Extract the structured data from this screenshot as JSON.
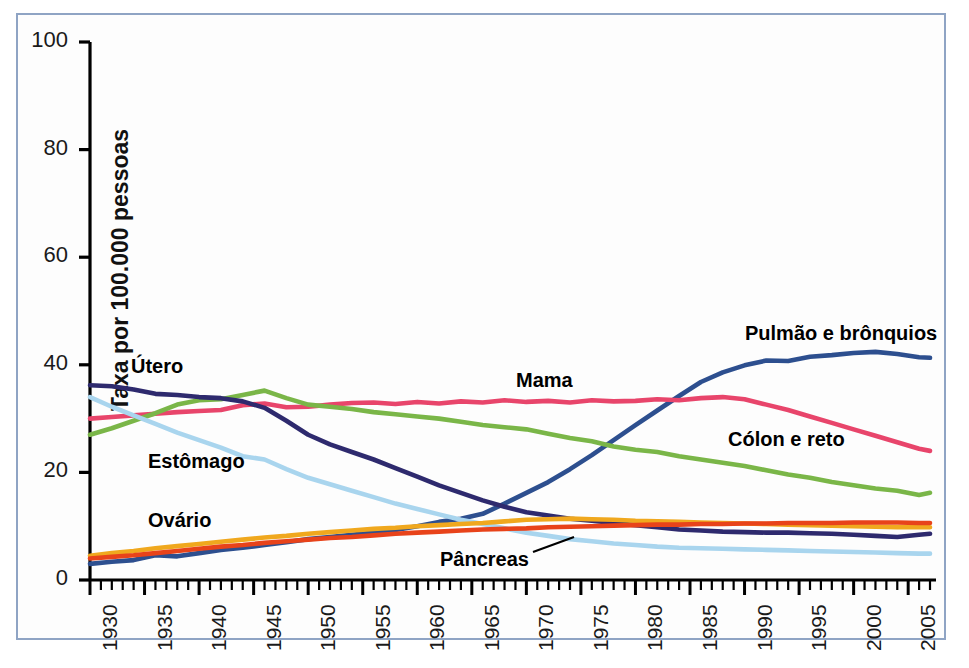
{
  "figure": {
    "border_color": "#8fa4c4",
    "background": "#ffffff"
  },
  "chart_data": {
    "type": "line",
    "title": "",
    "subtitle": "",
    "xlabel": "",
    "ylabel": "Taxa por 100.000 pessoas",
    "xlim": [
      1930,
      2007
    ],
    "ylim": [
      0,
      100
    ],
    "yticks": [
      0,
      20,
      40,
      60,
      80,
      100
    ],
    "ytick_labels": [
      "0",
      "20",
      "40",
      "60",
      "80",
      "100"
    ],
    "xticks": [
      1930,
      1935,
      1940,
      1945,
      1950,
      1955,
      1960,
      1965,
      1970,
      1975,
      1980,
      1985,
      1990,
      1995,
      2000,
      2005
    ],
    "xtick_labels": [
      "1930",
      "1935",
      "1940",
      "1945",
      "1950",
      "1955",
      "1960",
      "1965",
      "1970",
      "1975",
      "1980",
      "1985",
      "1990",
      "1995",
      "2000",
      "2005"
    ],
    "minor_tick_interval": 1,
    "grid": false,
    "legend_position": "inline-annotations",
    "x": [
      1930,
      1932,
      1934,
      1936,
      1938,
      1940,
      1942,
      1944,
      1946,
      1948,
      1950,
      1952,
      1954,
      1956,
      1958,
      1960,
      1962,
      1964,
      1966,
      1968,
      1970,
      1972,
      1974,
      1976,
      1978,
      1980,
      1982,
      1984,
      1986,
      1988,
      1990,
      1992,
      1994,
      1996,
      1998,
      2000,
      2002,
      2004,
      2006,
      2007
    ],
    "series": [
      {
        "name": "Pulmão e brônquios",
        "label": "Pulmão e brônquios",
        "color": "#2d4f8f",
        "values": [
          3.0,
          3.4,
          3.7,
          4.6,
          4.4,
          5.0,
          5.6,
          6.0,
          6.5,
          7.0,
          7.6,
          8.0,
          8.4,
          8.8,
          9.3,
          10.0,
          10.8,
          11.4,
          12.3,
          14.2,
          16.2,
          18.2,
          20.6,
          23.2,
          26.0,
          28.8,
          31.5,
          34.2,
          36.8,
          38.6,
          39.9,
          40.8,
          40.7,
          41.5,
          41.8,
          42.2,
          42.4,
          42.0,
          41.4,
          41.3
        ]
      },
      {
        "name": "Mama",
        "label": "Mama",
        "color": "#e8456b",
        "values": [
          30.0,
          30.3,
          30.6,
          30.9,
          31.2,
          31.4,
          31.6,
          32.5,
          32.8,
          32.1,
          32.2,
          32.6,
          32.9,
          33.0,
          32.7,
          33.1,
          32.8,
          33.2,
          33.0,
          33.4,
          33.1,
          33.3,
          33.0,
          33.4,
          33.2,
          33.3,
          33.6,
          33.4,
          33.8,
          34.0,
          33.6,
          32.6,
          31.6,
          30.4,
          29.2,
          28.0,
          26.8,
          25.6,
          24.4,
          24.0
        ]
      },
      {
        "name": "Cólon e reto",
        "label": "Cólon e reto",
        "color": "#7ab648",
        "values": [
          27.0,
          28.2,
          29.6,
          31.0,
          32.6,
          33.4,
          33.6,
          34.4,
          35.2,
          33.8,
          32.6,
          32.2,
          31.8,
          31.2,
          30.8,
          30.4,
          30.0,
          29.4,
          28.8,
          28.4,
          28.0,
          27.2,
          26.4,
          25.8,
          24.8,
          24.2,
          23.8,
          23.0,
          22.4,
          21.8,
          21.2,
          20.4,
          19.6,
          19.0,
          18.2,
          17.6,
          17.0,
          16.6,
          15.8,
          16.2
        ]
      },
      {
        "name": "Útero",
        "label": "Útero",
        "color": "#2e2a6e",
        "values": [
          36.2,
          36.0,
          35.4,
          34.6,
          34.4,
          34.0,
          33.8,
          33.2,
          32.0,
          29.6,
          27.0,
          25.2,
          23.8,
          22.4,
          20.8,
          19.2,
          17.6,
          16.2,
          14.8,
          13.6,
          12.6,
          12.0,
          11.4,
          11.0,
          10.6,
          10.2,
          9.8,
          9.4,
          9.2,
          9.0,
          8.9,
          8.8,
          8.8,
          8.7,
          8.6,
          8.4,
          8.2,
          8.0,
          8.4,
          8.6
        ]
      },
      {
        "name": "Estômago",
        "label": "Estômago",
        "color": "#a9d5ee",
        "values": [
          34.0,
          32.2,
          30.6,
          29.0,
          27.4,
          26.0,
          24.6,
          23.0,
          22.4,
          20.6,
          19.0,
          17.8,
          16.6,
          15.4,
          14.2,
          13.2,
          12.2,
          11.2,
          10.4,
          9.6,
          8.8,
          8.2,
          7.6,
          7.2,
          6.8,
          6.5,
          6.2,
          6.0,
          5.9,
          5.8,
          5.7,
          5.6,
          5.5,
          5.4,
          5.3,
          5.2,
          5.1,
          5.0,
          4.9,
          4.9
        ]
      },
      {
        "name": "Ovário",
        "label": "Ovário",
        "color": "#f0a81e",
        "values": [
          4.5,
          5.0,
          5.4,
          5.9,
          6.3,
          6.7,
          7.1,
          7.5,
          7.9,
          8.2,
          8.6,
          8.9,
          9.2,
          9.5,
          9.7,
          10.0,
          10.2,
          10.4,
          10.6,
          10.9,
          11.2,
          11.3,
          11.4,
          11.3,
          11.2,
          11.0,
          10.9,
          10.8,
          10.7,
          10.6,
          10.5,
          10.4,
          10.3,
          10.2,
          10.1,
          10.0,
          9.9,
          9.8,
          9.8,
          9.8
        ]
      },
      {
        "name": "Pâncreas",
        "label": "Pâncreas",
        "color": "#e8431a",
        "values": [
          4.0,
          4.3,
          4.6,
          5.0,
          5.4,
          5.8,
          6.2,
          6.5,
          6.9,
          7.2,
          7.5,
          7.8,
          8.0,
          8.3,
          8.6,
          8.8,
          9.0,
          9.2,
          9.4,
          9.5,
          9.6,
          9.8,
          9.9,
          10.0,
          10.1,
          10.2,
          10.3,
          10.3,
          10.4,
          10.4,
          10.5,
          10.5,
          10.6,
          10.6,
          10.6,
          10.7,
          10.7,
          10.7,
          10.6,
          10.6
        ]
      }
    ],
    "annotations": [
      {
        "name": "utero-label",
        "text": "Útero",
        "x_px": 131,
        "y_px": 355
      },
      {
        "name": "estomago-label",
        "text": "Estômago",
        "x_px": 148,
        "y_px": 450
      },
      {
        "name": "ovario-label",
        "text": "Ovário",
        "x_px": 148,
        "y_px": 509
      },
      {
        "name": "mama-label",
        "text": "Mama",
        "x_px": 516,
        "y_px": 369
      },
      {
        "name": "pancreas-label",
        "text": "Pâncreas",
        "x_px": 440,
        "y_px": 548
      },
      {
        "name": "pulmao-label",
        "text": "Pulmão e brônquios",
        "x_px": 745,
        "y_px": 322
      },
      {
        "name": "colon-label",
        "text": "Cólon e reto",
        "x_px": 728,
        "y_px": 428
      }
    ],
    "leader_lines": [
      {
        "name": "pancreas-leader",
        "x1_px": 533,
        "y1_px": 552,
        "x2_px": 574,
        "y2_px": 537
      }
    ]
  }
}
